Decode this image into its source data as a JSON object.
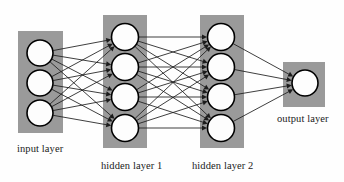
{
  "diagram": {
    "type": "neural-network-architecture",
    "background_color": "#fefefe",
    "box_color": "#9a9a9a",
    "neuron_fill": "#fdfdfd",
    "neuron_stroke": "#000000",
    "edge_color": "#1c1c1c",
    "label_color": "#1a1a1a",
    "canvas": {
      "width": 344,
      "height": 182
    },
    "layers": [
      {
        "id": "input",
        "label": "input layer",
        "neuron_count": 3,
        "box": {
          "x": 18,
          "y": 31,
          "width": 45,
          "height": 102
        },
        "neuron_cx": 40,
        "neuron_r": 13,
        "neuron_cy": [
          53,
          83,
          113
        ],
        "label_pos": {
          "x": 17,
          "y": 152
        }
      },
      {
        "id": "hidden1",
        "label": "hidden layer 1",
        "neuron_count": 4,
        "box": {
          "x": 103,
          "y": 15,
          "width": 44,
          "height": 133
        },
        "neuron_cx": 125,
        "neuron_r": 13.5,
        "neuron_cy": [
          37,
          67,
          97,
          128
        ],
        "label_pos": {
          "x": 101,
          "y": 169
        }
      },
      {
        "id": "hidden2",
        "label": "hidden layer 2",
        "neuron_count": 4,
        "box": {
          "x": 200,
          "y": 15,
          "width": 44,
          "height": 133
        },
        "neuron_cx": 221,
        "neuron_r": 13.5,
        "neuron_cy": [
          37,
          67,
          97,
          128
        ],
        "label_pos": {
          "x": 192,
          "y": 169
        }
      },
      {
        "id": "output",
        "label": "output layer",
        "neuron_count": 1,
        "box": {
          "x": 283,
          "y": 62,
          "width": 42,
          "height": 45
        },
        "neuron_cx": 305,
        "neuron_r": 13,
        "neuron_cy": [
          83
        ],
        "label_pos": {
          "x": 277,
          "y": 122
        }
      }
    ],
    "connections": [
      {
        "from": "input",
        "to": "hidden1",
        "fully_connected": true,
        "edge_count": 12,
        "arrowheads": true
      },
      {
        "from": "hidden1",
        "to": "hidden2",
        "fully_connected": true,
        "edge_count": 16,
        "arrowheads": true
      },
      {
        "from": "hidden2",
        "to": "output",
        "fully_connected": true,
        "edge_count": 4,
        "arrowheads": true
      }
    ]
  }
}
